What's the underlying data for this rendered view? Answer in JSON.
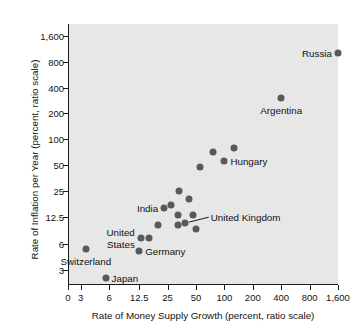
{
  "chart_data": {
    "type": "scatter",
    "title": "",
    "xlabel": "Rate of Money Supply Growth (percent, ratio scale)",
    "ylabel": "Rate of Inflation per Year (percent, ratio scale)",
    "xscale": "log",
    "yscale": "log",
    "grid": false,
    "legend": "none",
    "xticks": [
      "0",
      "3",
      "6",
      "12.5",
      "25",
      "50",
      "100",
      "200",
      "400",
      "800",
      "1,600"
    ],
    "xtick_values": [
      0,
      3,
      6,
      12.5,
      25,
      50,
      100,
      200,
      400,
      800,
      1600
    ],
    "yticks": [
      "3",
      "6",
      "12.5",
      "25",
      "50",
      "100",
      "200",
      "400",
      "800",
      "1,600"
    ],
    "ytick_values": [
      3,
      6,
      12.5,
      25,
      50,
      100,
      200,
      400,
      800,
      1600
    ],
    "xlim": [
      2.2,
      1600
    ],
    "ylim": [
      2.0,
      2200
    ],
    "point_color": "#595959",
    "plot_background": "#e7e7e7",
    "points": [
      {
        "label": "Russia",
        "x": 1600,
        "y": 1000,
        "label_pos": "left"
      },
      {
        "label": "Argentina",
        "x": 400,
        "y": 300,
        "label_pos": "below"
      },
      {
        "label": "Hungary",
        "x": 100,
        "y": 55,
        "label_pos": "right"
      },
      {
        "label": "",
        "x": 75,
        "y": 70,
        "label_pos": "none"
      },
      {
        "label": "",
        "x": 125,
        "y": 80,
        "label_pos": "none"
      },
      {
        "label": "",
        "x": 55,
        "y": 48,
        "label_pos": "none"
      },
      {
        "label": "",
        "x": 33,
        "y": 25,
        "label_pos": "none"
      },
      {
        "label": "",
        "x": 42,
        "y": 20,
        "label_pos": "none"
      },
      {
        "label": "India",
        "x": 23,
        "y": 16,
        "label_pos": "left"
      },
      {
        "label": "",
        "x": 27,
        "y": 17,
        "label_pos": "none"
      },
      {
        "label": "",
        "x": 32,
        "y": 13,
        "label_pos": "none"
      },
      {
        "label": "",
        "x": 46,
        "y": 13,
        "label_pos": "none"
      },
      {
        "label": "United Kingdom",
        "x": 38,
        "y": 10.5,
        "label_pos": "leader"
      },
      {
        "label": "",
        "x": 32,
        "y": 10,
        "label_pos": "none"
      },
      {
        "label": "",
        "x": 50,
        "y": 9,
        "label_pos": "none"
      },
      {
        "label": "United States",
        "x": 13,
        "y": 7,
        "label_pos": "left"
      },
      {
        "label": "",
        "x": 20,
        "y": 10,
        "label_pos": "none"
      },
      {
        "label": "",
        "x": 16,
        "y": 7,
        "label_pos": "none"
      },
      {
        "label": "Germany",
        "x": 12.5,
        "y": 5,
        "label_pos": "right"
      },
      {
        "label": "Switzerland",
        "x": 3.4,
        "y": 5.2,
        "label_pos": "below"
      },
      {
        "label": "Japan",
        "x": 5.5,
        "y": 2.4,
        "label_pos": "right"
      }
    ]
  }
}
